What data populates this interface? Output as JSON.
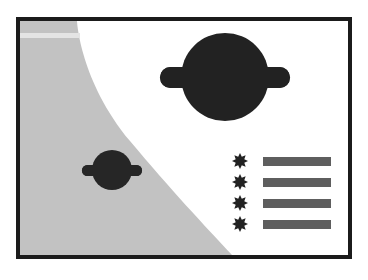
{
  "poster": {
    "title": "Planets and starred list illustration",
    "background_color": "#ffffff",
    "frame_color": "#1b1b1b",
    "sky_color": "#ffffff",
    "planet_surface_color": "#c2c2c2",
    "planet_surface_highlight_color": "#e2e2e2",
    "object_color": "#222222",
    "bar_color": "#5e5e5e"
  },
  "scene": {
    "planet_surface": {
      "name": "large-gray-planet-limb",
      "description": "Large gray curved planet surface filling the lower-left corner",
      "highlight_band_label": "horizon highlight streak"
    },
    "planets": [
      {
        "name": "large-ringed-planet",
        "label": "Large ringed planet",
        "cx": 205,
        "cy": 73,
        "r": 44,
        "ring_width": 130,
        "ring_height": 20
      },
      {
        "name": "small-ringed-planet",
        "label": "Small ringed planet",
        "cx": 107,
        "cy": 166,
        "r": 20,
        "ring_width": 60,
        "ring_height": 10
      }
    ],
    "list": {
      "name": "starred-list",
      "bullet_icon": "eight-point-star-icon",
      "rows": [
        {
          "bullet": "eight-point-star-icon",
          "bar_label": ""
        },
        {
          "bullet": "eight-point-star-icon",
          "bar_label": ""
        },
        {
          "bullet": "eight-point-star-icon",
          "bar_label": ""
        },
        {
          "bullet": "eight-point-star-icon",
          "bar_label": ""
        }
      ]
    }
  }
}
